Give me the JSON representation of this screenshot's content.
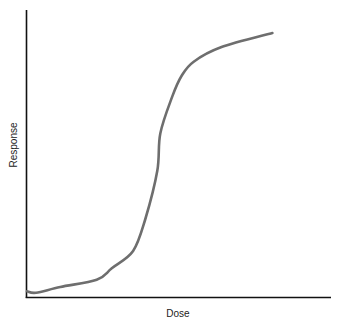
{
  "chart_data": {
    "type": "line",
    "title": "",
    "xlabel": "Dose",
    "ylabel": "Response",
    "grid": false,
    "legend": null,
    "ticks": {
      "x": [],
      "y": []
    },
    "xlim": [
      0,
      1
    ],
    "ylim": [
      0,
      1
    ],
    "series": [
      {
        "name": "dose-response",
        "color": "#6e6e6e",
        "points": [
          [
            0.0,
            0.02
          ],
          [
            0.03,
            0.015
          ],
          [
            0.11,
            0.035
          ],
          [
            0.23,
            0.06
          ],
          [
            0.28,
            0.1
          ],
          [
            0.35,
            0.16
          ],
          [
            0.39,
            0.27
          ],
          [
            0.43,
            0.44
          ],
          [
            0.44,
            0.57
          ],
          [
            0.48,
            0.7
          ],
          [
            0.51,
            0.77
          ],
          [
            0.55,
            0.82
          ],
          [
            0.64,
            0.87
          ],
          [
            0.81,
            0.92
          ]
        ]
      }
    ]
  },
  "labels": {
    "x": "Dose",
    "y": "Response"
  },
  "colors": {
    "axis": "#111111",
    "curve": "#6e6e6e"
  }
}
